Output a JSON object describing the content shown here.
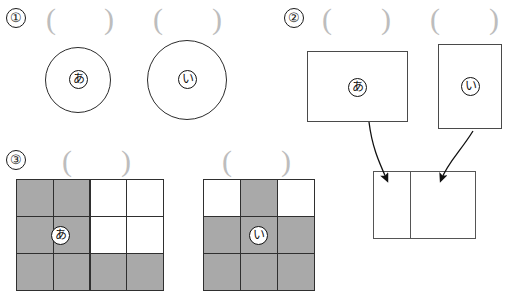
{
  "worksheet": {
    "width": 524,
    "height": 291,
    "background": "#ffffff",
    "ink_color": "#2b2b2b",
    "fill_gray": "#a9a9a9",
    "paren_gray": "#bdbdbd"
  },
  "problems": [
    {
      "id": "problem-1",
      "number": "①",
      "type": "circles",
      "answer_blanks": [
        {
          "open": "(",
          "close": ")"
        },
        {
          "open": "(",
          "close": ")"
        }
      ],
      "shapes": [
        {
          "label": "あ",
          "kind": "circle",
          "diameter_px": 66
        },
        {
          "label": "い",
          "kind": "circle",
          "diameter_px": 80
        }
      ]
    },
    {
      "id": "problem-2",
      "number": "②",
      "type": "rectangles-with-arrows",
      "answer_blanks": [
        {
          "open": "(",
          "close": ")"
        },
        {
          "open": "(",
          "close": ")"
        }
      ],
      "shapes": [
        {
          "label": "あ",
          "kind": "rectangle",
          "width_px": 101,
          "height_px": 71,
          "orientation": "landscape"
        },
        {
          "label": "い",
          "kind": "rectangle",
          "width_px": 64,
          "height_px": 85,
          "orientation": "portrait"
        }
      ],
      "targets": [
        {
          "kind": "square",
          "width_px": 66,
          "height_px": 68
        },
        {
          "kind": "square",
          "width_px": 66,
          "height_px": 68
        }
      ],
      "arrows": [
        {
          "from": "あ",
          "to": "target-left"
        },
        {
          "from": "い",
          "to": "target-right"
        }
      ]
    },
    {
      "id": "problem-3",
      "number": "③",
      "type": "grids",
      "answer_blanks": [
        {
          "open": "(",
          "close": ")"
        },
        {
          "open": "(",
          "close": ")"
        }
      ],
      "grids": [
        {
          "label": "あ",
          "columns": 4,
          "rows": 3,
          "label_cell": {
            "row": 1,
            "col": 0
          },
          "cells": [
            [
              1,
              1,
              0,
              0
            ],
            [
              1,
              1,
              0,
              0
            ],
            [
              1,
              1,
              1,
              1
            ]
          ],
          "filled_count": 8
        },
        {
          "label": "い",
          "columns": 3,
          "rows": 3,
          "label_cell": {
            "row": 1,
            "col": 1
          },
          "cells": [
            [
              0,
              1,
              0
            ],
            [
              1,
              1,
              1
            ],
            [
              1,
              1,
              1
            ]
          ],
          "filled_count": 7
        }
      ]
    }
  ]
}
